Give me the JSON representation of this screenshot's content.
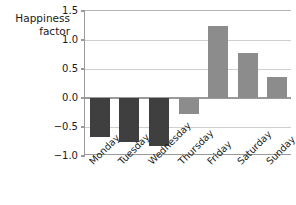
{
  "chart_data": {
    "type": "bar",
    "title": "",
    "subtitle": "",
    "xlabel": "",
    "ylabel": "Happiness factor",
    "ylabel_lines": [
      "Happiness",
      "factor"
    ],
    "categories": [
      "Monday",
      "Tuesday",
      "Wednesday",
      "Thursday",
      "Friday",
      "Saturday",
      "Sunday"
    ],
    "values": [
      -0.68,
      -0.75,
      -0.82,
      -0.28,
      1.24,
      0.78,
      0.36
    ],
    "bar_colors": [
      "#3f3f3f",
      "#3f3f3f",
      "#3f3f3f",
      "#8c8c8c",
      "#8c8c8c",
      "#8c8c8c",
      "#8c8c8c"
    ],
    "ylim": [
      -1.0,
      1.5
    ],
    "yticks": [
      1.5,
      1.0,
      0.5,
      0.0,
      -0.5,
      -1.0
    ],
    "ytick_labels": [
      "1.5",
      "1.0",
      "0.5",
      "0.0",
      "−0.5",
      "−1.0"
    ],
    "grid": true,
    "grid_axis": "y",
    "legend": false,
    "legend_position": "none",
    "xtick_rotation": -45,
    "colors": {
      "dark_bar": "#3f3f3f",
      "light_bar": "#8c8c8c",
      "gridline": "#cfcfcf",
      "axis": "#9a9a9a",
      "text": "#1a1a1a",
      "background": "#ffffff"
    }
  }
}
